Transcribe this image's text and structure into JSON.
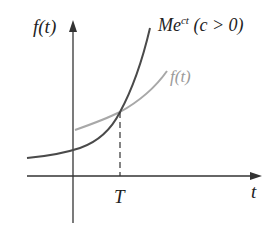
{
  "diagram": {
    "y_axis_label": "f(t)",
    "x_axis_label": "t",
    "x_marker_label": "T",
    "curve_exponential": {
      "label_base": "Me",
      "label_exponent": "ct",
      "label_condition": "(c > 0)",
      "color": "#4a4a4a"
    },
    "curve_f": {
      "label": "f(t)",
      "color": "#a8a8a8"
    },
    "axis_color": "#333333"
  }
}
